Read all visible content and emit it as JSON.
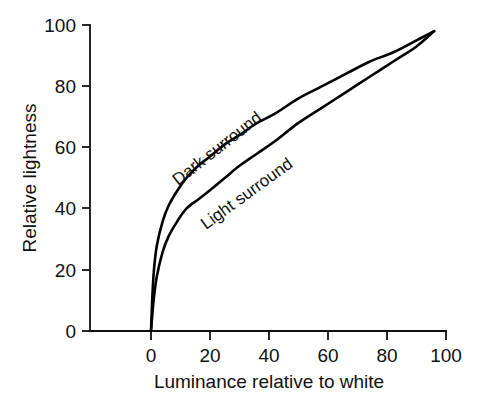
{
  "chart_data": {
    "type": "line",
    "title": "",
    "subtitle": "",
    "xlabel": "Luminance relative to white",
    "ylabel": "Relative lightness",
    "xlim": [
      0,
      100
    ],
    "ylim": [
      0,
      100
    ],
    "xticks": [
      0,
      20,
      40,
      60,
      80,
      100
    ],
    "yticks": [
      0,
      20,
      40,
      60,
      80,
      100
    ],
    "xtick_labels": [
      "0",
      "20",
      "40",
      "60",
      "80",
      "100"
    ],
    "ytick_labels": [
      "0",
      "20",
      "40",
      "60",
      "80",
      "100"
    ],
    "grid": false,
    "legend_position": "inline-curve-labels",
    "annotations": [
      "Dark surround",
      "Light surround"
    ],
    "series": [
      {
        "name": "Dark surround",
        "label_text": "Dark surround",
        "color": "#000000",
        "x": [
          0,
          0.5,
          1,
          2,
          4,
          6,
          9,
          12,
          16,
          20,
          25,
          30,
          36,
          42,
          50,
          58,
          66,
          74,
          82,
          90,
          96
        ],
        "values": [
          0,
          12,
          20,
          28,
          36,
          41,
          46,
          50,
          54,
          57,
          61,
          64,
          68,
          71,
          76,
          80,
          84,
          88,
          91,
          95,
          98
        ]
      },
      {
        "name": "Light surround",
        "label_text": "Light surround",
        "color": "#000000",
        "x": [
          0,
          0.5,
          1,
          2,
          4,
          6,
          9,
          12,
          16,
          20,
          25,
          30,
          36,
          42,
          50,
          58,
          66,
          74,
          82,
          90,
          96
        ],
        "values": [
          0,
          6,
          11,
          18,
          26,
          31,
          36,
          40,
          43,
          46,
          50,
          54,
          58,
          62,
          68,
          73,
          78,
          83,
          88,
          93,
          98
        ]
      }
    ]
  }
}
